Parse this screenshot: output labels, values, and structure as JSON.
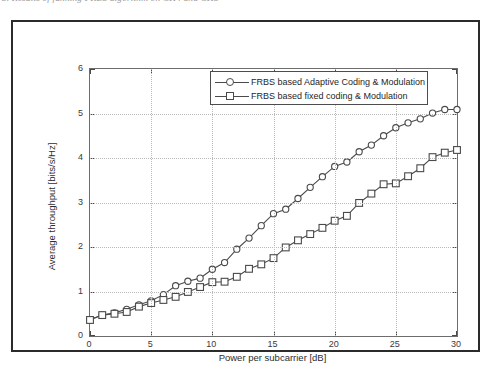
{
  "caption": {
    "text": "3. Results of funning FRBS algorithm on CH4 and CH5"
  },
  "figure": {
    "frame_color": "#2b2b2b",
    "axes_color": "#6d6d6d",
    "grid_color": "#b9b9b9",
    "line_color": "#4a4a4a"
  },
  "legend": {
    "position": "top-center",
    "entries": [
      {
        "label": "FRBS based Adaptive Coding & Modulation",
        "marker": "circle-marker"
      },
      {
        "label": "FRBS based fixed coding & Modulation",
        "marker": "square-marker"
      }
    ]
  },
  "chart_data": {
    "type": "line",
    "title": "",
    "subtitle": "",
    "xlabel": "Power per subcarrier [dB]",
    "ylabel": "Average throughput [bits/s/Hz]",
    "xlim": [
      0,
      30
    ],
    "ylim": [
      0,
      6
    ],
    "xticks": [
      0,
      5,
      10,
      15,
      20,
      25,
      30
    ],
    "yticks": [
      0,
      1,
      2,
      3,
      4,
      5,
      6
    ],
    "grid": true,
    "legend_position": "top-center",
    "x": [
      0,
      1,
      2,
      3,
      4,
      5,
      6,
      7,
      8,
      9,
      10,
      11,
      12,
      13,
      14,
      15,
      16,
      17,
      18,
      19,
      20,
      21,
      22,
      23,
      24,
      25,
      26,
      27,
      28,
      29,
      30
    ],
    "series": [
      {
        "name": "FRBS based Adaptive Coding & Modulation",
        "marker": "circle-marker",
        "values": [
          0.37,
          0.47,
          0.52,
          0.6,
          0.7,
          0.79,
          0.93,
          1.13,
          1.23,
          1.3,
          1.5,
          1.65,
          1.95,
          2.2,
          2.48,
          2.75,
          2.85,
          3.09,
          3.34,
          3.58,
          3.81,
          3.91,
          4.14,
          4.29,
          4.5,
          4.68,
          4.79,
          4.88,
          5.01,
          5.09,
          5.09
        ]
      },
      {
        "name": "FRBS based fixed coding & Modulation",
        "marker": "square-marker",
        "values": [
          0.36,
          0.47,
          0.5,
          0.54,
          0.66,
          0.74,
          0.81,
          0.88,
          0.99,
          1.1,
          1.21,
          1.22,
          1.33,
          1.51,
          1.61,
          1.75,
          1.99,
          2.15,
          2.29,
          2.43,
          2.59,
          2.7,
          2.99,
          3.2,
          3.41,
          3.43,
          3.59,
          3.77,
          4.02,
          4.12,
          4.18
        ]
      }
    ]
  }
}
